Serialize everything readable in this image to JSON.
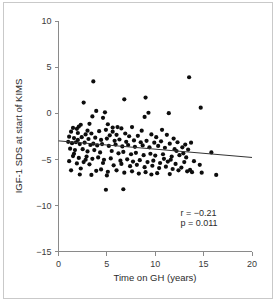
{
  "chart_data": {
    "type": "scatter",
    "title": "",
    "xlabel": "Time on GH (years)",
    "ylabel": "IGF-1 SDS at start of KIMS",
    "xlim": [
      0,
      20
    ],
    "ylim": [
      -15,
      10
    ],
    "xticks": [
      0,
      5,
      10,
      15,
      20
    ],
    "yticks": [
      10,
      5,
      0,
      -5,
      -10,
      -15
    ],
    "xtick_labels": [
      "0",
      "5",
      "10",
      "15",
      "20"
    ],
    "ytick_labels": [
      "10",
      "5",
      "0",
      "−5",
      "−10",
      "−15"
    ],
    "grid": false,
    "legend": null,
    "marker_color": "#0d0d0d",
    "marker_size": 2.1,
    "annotations": [
      {
        "name": "correlation",
        "text": "r = −0.21",
        "x": 12.6,
        "y": -11.1
      },
      {
        "name": "p-value",
        "text": "p = 0.011",
        "x": 12.6,
        "y": -12.2
      }
    ],
    "fit_line": {
      "name": "linear-regression",
      "color": "#333333",
      "x": [
        0,
        20
      ],
      "y": [
        -3.0,
        -4.8
      ],
      "slope": -0.09,
      "intercept": -3.0,
      "r": -0.21,
      "p": 0.011
    },
    "points": [
      [
        3.6,
        3.45
      ],
      [
        13.5,
        3.9
      ],
      [
        2.6,
        1.15
      ],
      [
        6.8,
        1.5
      ],
      [
        9.0,
        1.7
      ],
      [
        3.9,
        0.25
      ],
      [
        4.8,
        0.1
      ],
      [
        11.4,
        0.0
      ],
      [
        14.7,
        0.6
      ],
      [
        9.3,
        0.05
      ],
      [
        8.9,
        -0.4
      ],
      [
        3.5,
        -0.35
      ],
      [
        4.6,
        -0.5
      ],
      [
        2.3,
        -1.25
      ],
      [
        3.2,
        -1.15
      ],
      [
        5.1,
        -1.2
      ],
      [
        1.5,
        -1.6
      ],
      [
        1.9,
        -1.7
      ],
      [
        2.1,
        -1.45
      ],
      [
        5.6,
        -1.55
      ],
      [
        6.1,
        -1.5
      ],
      [
        6.5,
        -1.65
      ],
      [
        7.6,
        -1.5
      ],
      [
        3.0,
        -1.9
      ],
      [
        4.2,
        -1.95
      ],
      [
        4.9,
        -1.8
      ],
      [
        1.3,
        -2.0
      ],
      [
        2.0,
        -2.15
      ],
      [
        2.8,
        -2.3
      ],
      [
        3.4,
        -2.2
      ],
      [
        5.3,
        -2.4
      ],
      [
        6.0,
        -2.35
      ],
      [
        6.9,
        -2.2
      ],
      [
        7.3,
        -2.5
      ],
      [
        8.2,
        -2.45
      ],
      [
        9.6,
        -2.3
      ],
      [
        10.1,
        -2.6
      ],
      [
        11.2,
        -2.35
      ],
      [
        11.9,
        -2.75
      ],
      [
        1.1,
        -2.55
      ],
      [
        1.6,
        -2.7
      ],
      [
        2.4,
        -2.6
      ],
      [
        3.1,
        -2.8
      ],
      [
        3.8,
        -2.65
      ],
      [
        4.4,
        -2.9
      ],
      [
        5.0,
        -2.75
      ],
      [
        5.8,
        -3.0
      ],
      [
        6.3,
        -2.85
      ],
      [
        7.0,
        -3.1
      ],
      [
        7.8,
        -2.95
      ],
      [
        8.5,
        -3.15
      ],
      [
        9.1,
        -3.0
      ],
      [
        9.9,
        -3.2
      ],
      [
        10.6,
        -3.05
      ],
      [
        11.5,
        -3.3
      ],
      [
        12.3,
        -3.15
      ],
      [
        13.1,
        -3.4
      ],
      [
        13.7,
        -3.2
      ],
      [
        1.0,
        -3.1
      ],
      [
        1.4,
        -3.25
      ],
      [
        1.8,
        -3.15
      ],
      [
        2.2,
        -3.35
      ],
      [
        2.7,
        -3.2
      ],
      [
        3.3,
        -3.45
      ],
      [
        3.6,
        -3.3
      ],
      [
        4.0,
        -3.5
      ],
      [
        4.5,
        -3.35
      ],
      [
        5.2,
        -3.55
      ],
      [
        5.9,
        -3.4
      ],
      [
        6.6,
        -3.6
      ],
      [
        7.2,
        -3.45
      ],
      [
        7.9,
        -3.65
      ],
      [
        8.7,
        -3.5
      ],
      [
        9.4,
        -3.7
      ],
      [
        10.3,
        -3.55
      ],
      [
        11.0,
        -3.75
      ],
      [
        12.0,
        -3.9
      ],
      [
        12.8,
        -3.7
      ],
      [
        13.4,
        -3.95
      ],
      [
        15.8,
        -4.25
      ],
      [
        1.2,
        -3.85
      ],
      [
        1.7,
        -4.0
      ],
      [
        2.5,
        -3.9
      ],
      [
        3.0,
        -4.15
      ],
      [
        3.7,
        -4.0
      ],
      [
        4.3,
        -4.25
      ],
      [
        5.5,
        -4.1
      ],
      [
        6.2,
        -4.35
      ],
      [
        6.7,
        -4.2
      ],
      [
        7.5,
        -4.45
      ],
      [
        8.0,
        -4.3
      ],
      [
        8.8,
        -4.55
      ],
      [
        9.5,
        -4.4
      ],
      [
        10.0,
        -4.6
      ],
      [
        10.8,
        -4.45
      ],
      [
        11.7,
        -4.7
      ],
      [
        12.5,
        -4.55
      ],
      [
        13.2,
        -4.8
      ],
      [
        1.5,
        -4.65
      ],
      [
        2.1,
        -4.85
      ],
      [
        2.9,
        -4.7
      ],
      [
        3.5,
        -4.95
      ],
      [
        4.1,
        -4.8
      ],
      [
        4.7,
        -5.05
      ],
      [
        5.4,
        -4.9
      ],
      [
        6.4,
        -5.15
      ],
      [
        7.1,
        -5.0
      ],
      [
        7.7,
        -5.25
      ],
      [
        8.4,
        -5.1
      ],
      [
        9.2,
        -5.3
      ],
      [
        9.8,
        -5.15
      ],
      [
        10.5,
        -5.4
      ],
      [
        11.3,
        -5.25
      ],
      [
        12.1,
        -5.5
      ],
      [
        13.0,
        -5.3
      ],
      [
        14.6,
        -5.6
      ],
      [
        1.1,
        -5.2
      ],
      [
        1.9,
        -5.45
      ],
      [
        2.6,
        -5.3
      ],
      [
        3.2,
        -5.55
      ],
      [
        4.6,
        -5.4
      ],
      [
        5.7,
        -5.65
      ],
      [
        6.5,
        -5.5
      ],
      [
        7.4,
        -5.75
      ],
      [
        8.1,
        -5.6
      ],
      [
        8.9,
        -5.85
      ],
      [
        9.7,
        -5.7
      ],
      [
        10.4,
        -5.95
      ],
      [
        11.1,
        -5.8
      ],
      [
        11.8,
        -6.05
      ],
      [
        12.7,
        -5.9
      ],
      [
        13.6,
        -6.15
      ],
      [
        2.3,
        -6.0
      ],
      [
        3.9,
        -6.25
      ],
      [
        4.4,
        -6.1
      ],
      [
        5.1,
        -6.35
      ],
      [
        6.0,
        -6.2
      ],
      [
        6.8,
        -6.45
      ],
      [
        7.6,
        -6.3
      ],
      [
        8.3,
        -6.55
      ],
      [
        9.0,
        -6.4
      ],
      [
        9.6,
        -6.65
      ],
      [
        10.2,
        -6.5
      ],
      [
        11.5,
        -6.6
      ],
      [
        13.3,
        -6.3
      ],
      [
        13.8,
        -6.4
      ],
      [
        16.3,
        -6.7
      ],
      [
        2.2,
        -6.65
      ],
      [
        1.3,
        -6.2
      ],
      [
        2.8,
        -5.05
      ],
      [
        4.9,
        -8.3
      ],
      [
        6.7,
        -8.25
      ],
      [
        5.0,
        -6.75
      ],
      [
        3.4,
        -6.7
      ],
      [
        12.4,
        -6.2
      ],
      [
        14.0,
        -5.2
      ],
      [
        10.9,
        -4.95
      ],
      [
        12.2,
        -4.1
      ],
      [
        14.8,
        -6.45
      ],
      [
        1.6,
        -4.4
      ],
      [
        2.0,
        -2.9
      ],
      [
        8.6,
        -1.9
      ],
      [
        10.7,
        -1.8
      ],
      [
        11.6,
        -5.05
      ],
      [
        12.9,
        -4.35
      ],
      [
        5.6,
        -2.0
      ]
    ]
  },
  "figure": {
    "background_color": "#ffffff",
    "border_color": "#c9c9c9",
    "axis_color": "#8a8a8a",
    "text_color": "#2b2b2b"
  }
}
